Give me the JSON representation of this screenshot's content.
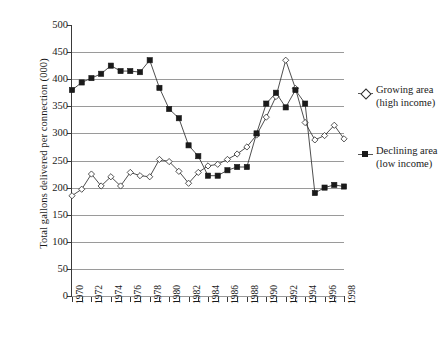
{
  "chart_data": {
    "type": "line",
    "title": "",
    "xlabel": "",
    "ylabel": "Total gallons delivered per connection (000)",
    "ylim": [
      0,
      500
    ],
    "ytick_step": 50,
    "yticks": [
      500,
      450,
      400,
      350,
      300,
      250,
      200,
      150,
      100,
      50,
      0
    ],
    "xlim": [
      1970,
      1998
    ],
    "xticks_all_years": true,
    "xtick_labels": [
      "1970",
      "1972",
      "1974",
      "1976",
      "1978",
      "1980",
      "1982",
      "1984",
      "1986",
      "1988",
      "1990",
      "1992",
      "1994",
      "1996",
      "1998"
    ],
    "x": [
      1970,
      1971,
      1972,
      1973,
      1974,
      1975,
      1976,
      1977,
      1978,
      1979,
      1980,
      1981,
      1982,
      1983,
      1984,
      1985,
      1986,
      1987,
      1988,
      1989,
      1990,
      1991,
      1992,
      1993,
      1994,
      1995,
      1996,
      1997,
      1998
    ],
    "grid": true,
    "grid_axis": "y",
    "legend_position": "right",
    "series": [
      {
        "name": "Growing area (high income)",
        "label_line1": "Growing area",
        "label_line2": "(high income)",
        "marker": "diamond",
        "marker_fill": "#ffffff",
        "color": "#3a3a3a",
        "values": [
          185,
          197,
          225,
          203,
          220,
          203,
          228,
          222,
          220,
          252,
          248,
          230,
          208,
          228,
          240,
          243,
          252,
          262,
          275,
          297,
          330,
          368,
          435,
          383,
          320,
          288,
          296,
          315,
          290
        ]
      },
      {
        "name": "Declining area (low income)",
        "label_line1": "Declining area",
        "label_line2": "(low income)",
        "marker": "square",
        "marker_fill": "#1a1a1a",
        "color": "#3a3a3a",
        "values": [
          380,
          394,
          402,
          410,
          425,
          415,
          415,
          413,
          435,
          384,
          345,
          328,
          278,
          258,
          222,
          222,
          232,
          238,
          238,
          300,
          355,
          375,
          348,
          380,
          355,
          190,
          200,
          205,
          202
        ]
      }
    ]
  },
  "legend": {
    "entries": [
      {
        "line1": "Growing area",
        "line2": "(high income)",
        "symbol": "diamond-marker-icon"
      },
      {
        "line1": "Declining area",
        "line2": "(low income)",
        "symbol": "square-marker-icon"
      }
    ]
  },
  "colors": {
    "axis": "#3a3a3a",
    "gridline": "#9a9a9a",
    "background": "#ffffff",
    "series_growing": "#ffffff",
    "series_declining": "#1a1a1a"
  }
}
